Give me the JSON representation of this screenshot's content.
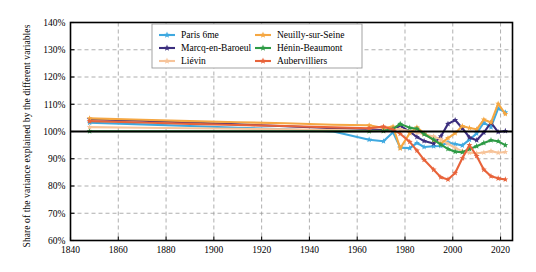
{
  "chart_data": {
    "type": "line",
    "title": "",
    "xlabel": "",
    "ylabel": "Share of the variance explained by the different variables",
    "xlim": [
      1840,
      2025
    ],
    "ylim": [
      60,
      140
    ],
    "yticks": [
      60,
      70,
      80,
      90,
      100,
      110,
      120,
      130,
      140
    ],
    "ytick_labels": [
      "60%",
      "70%",
      "80%",
      "90%",
      "100%",
      "110%",
      "120%",
      "130%",
      "140%"
    ],
    "xticks": [
      1840,
      1860,
      1880,
      1900,
      1920,
      1940,
      1960,
      1980,
      2000,
      2020
    ],
    "xtick_labels": [
      "1840",
      "1860",
      "1880",
      "1900",
      "1920",
      "1940",
      "1960",
      "1980",
      "2000",
      "2020"
    ],
    "grid": true,
    "grid_style": "dashed",
    "reference_line": 100,
    "legend_position": "top-center",
    "legend_columns": 2,
    "marker": "star",
    "series": [
      {
        "name": "Paris 6me",
        "color": "#3FA9E0",
        "x": [
          1848,
          1870,
          1890,
          1910,
          1930,
          1950,
          1965,
          1971,
          1975,
          1978,
          1982,
          1985,
          1988,
          1992,
          1995,
          1998,
          2001,
          2004,
          2007,
          2010,
          2013,
          2016,
          2019,
          2022
        ],
        "values": [
          103.2,
          102.6,
          102.0,
          101.4,
          100.8,
          100.0,
          97.0,
          96.4,
          99.7,
          94.1,
          93.9,
          95.8,
          94.3,
          94.6,
          94.7,
          96.0,
          95.4,
          94.9,
          97.0,
          99.3,
          103.3,
          101.6,
          108.5,
          107.0
        ]
      },
      {
        "name": "Marcq-en-Baroeul",
        "color": "#3B2E7E",
        "x": [
          1848,
          1870,
          1890,
          1910,
          1930,
          1950,
          1965,
          1971,
          1975,
          1978,
          1982,
          1985,
          1988,
          1992,
          1995,
          1998,
          2001,
          2004,
          2007,
          2010,
          2013,
          2016,
          2019,
          2022
        ],
        "values": [
          104.5,
          104.0,
          103.3,
          102.6,
          101.9,
          101.2,
          100.8,
          100.4,
          100.8,
          102.2,
          99.9,
          98.0,
          96.5,
          95.6,
          98.2,
          102.8,
          104.2,
          101.2,
          97.8,
          96.8,
          99.6,
          103.3,
          99.8,
          100.2
        ]
      },
      {
        "name": "Liévin",
        "color": "#F7C49A",
        "x": [
          1848,
          1870,
          1890,
          1910,
          1930,
          1950,
          1965,
          1971,
          1975,
          1978,
          1982,
          1985,
          1988,
          1992,
          1995,
          1998,
          2001,
          2004,
          2007,
          2010,
          2013,
          2016,
          2019,
          2022
        ],
        "values": [
          101.6,
          101.4,
          101.2,
          101.0,
          100.8,
          100.5,
          100.3,
          100.2,
          101.0,
          100.8,
          100.2,
          99.6,
          99.0,
          98.2,
          97.1,
          95.5,
          94.0,
          92.8,
          92.2,
          92.0,
          92.3,
          92.8,
          92.2,
          92.5
        ]
      },
      {
        "name": "Neuilly-sur-Seine",
        "color": "#F5A742",
        "x": [
          1848,
          1870,
          1890,
          1910,
          1930,
          1950,
          1965,
          1971,
          1975,
          1978,
          1982,
          1985,
          1988,
          1992,
          1995,
          1998,
          2001,
          2004,
          2007,
          2010,
          2013,
          2016,
          2019,
          2022
        ],
        "values": [
          104.8,
          104.3,
          103.8,
          103.4,
          103.0,
          102.5,
          102.3,
          101.3,
          101.8,
          93.8,
          99.4,
          101.5,
          99.3,
          96.8,
          95.6,
          97.6,
          99.4,
          102.0,
          101.3,
          100.8,
          104.4,
          103.3,
          110.2,
          106.4
        ]
      },
      {
        "name": "Hénin-Beaumont",
        "color": "#2E9B45",
        "x": [
          1848,
          1870,
          1890,
          1910,
          1930,
          1950,
          1965,
          1971,
          1975,
          1978,
          1982,
          1985,
          1988,
          1992,
          1995,
          1998,
          2001,
          2004,
          2007,
          2010,
          2013,
          2016,
          2019,
          2022
        ],
        "values": [
          100.1,
          100.1,
          100.1,
          100.1,
          100.1,
          100.1,
          100.1,
          100.2,
          101.0,
          102.8,
          101.4,
          101.0,
          99.0,
          97.0,
          95.2,
          93.6,
          92.6,
          92.4,
          93.6,
          94.6,
          95.8,
          96.8,
          96.4,
          95.0
        ]
      },
      {
        "name": "Aubervilliers",
        "color": "#E8633A",
        "x": [
          1848,
          1870,
          1890,
          1910,
          1930,
          1950,
          1965,
          1971,
          1975,
          1978,
          1982,
          1985,
          1988,
          1992,
          1995,
          1998,
          2001,
          2004,
          2007,
          2010,
          2013,
          2016,
          2019,
          2022
        ],
        "values": [
          103.8,
          103.3,
          102.8,
          102.4,
          102.0,
          101.5,
          101.2,
          101.8,
          100.6,
          99.2,
          96.2,
          93.0,
          89.6,
          86.0,
          83.2,
          82.4,
          84.8,
          90.2,
          95.0,
          91.0,
          86.0,
          83.6,
          82.8,
          82.4
        ]
      }
    ]
  },
  "legend": {
    "items": [
      {
        "label": "Paris 6me"
      },
      {
        "label": "Neuilly-sur-Seine"
      },
      {
        "label": "Marcq-en-Baroeul"
      },
      {
        "label": "Hénin-Beaumont"
      },
      {
        "label": "Liévin"
      },
      {
        "label": "Aubervilliers"
      }
    ]
  }
}
